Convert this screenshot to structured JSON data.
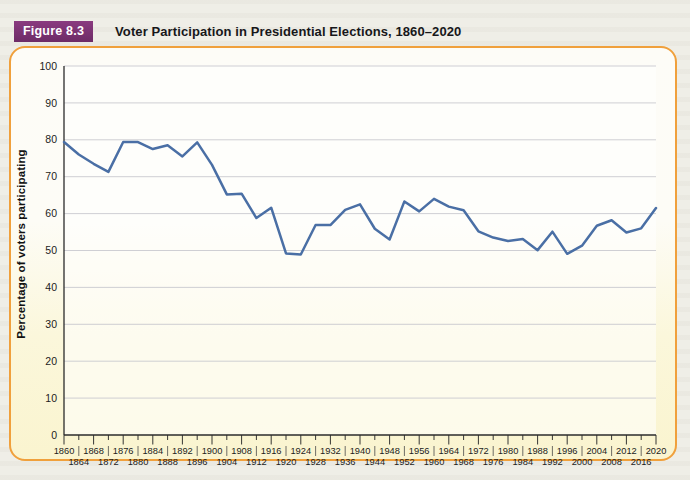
{
  "figure": {
    "badge": "Figure 8.3",
    "title": "Voter Participation in Presidential Elections, 1860–2020"
  },
  "colors": {
    "badge_bg": "#77306f",
    "panel_border": "#f0a03c",
    "line": "#4a6fa5",
    "grid": "#c9c9cf",
    "axis": "#2b2b2b",
    "page_bg": "#efeee7"
  },
  "chart_data": {
    "type": "line",
    "title": "Voter Participation in Presidential Elections, 1860–2020",
    "xlabel": "",
    "ylabel": "Percentage of voters participating",
    "ylim": [
      0,
      100
    ],
    "ytick_step": 10,
    "yticks": [
      0,
      10,
      20,
      30,
      40,
      50,
      60,
      70,
      80,
      90,
      100
    ],
    "grid": true,
    "legend": "none",
    "xlim": [
      1860,
      2020
    ],
    "x": [
      1860,
      1864,
      1868,
      1872,
      1876,
      1880,
      1884,
      1888,
      1892,
      1896,
      1900,
      1904,
      1908,
      1912,
      1916,
      1920,
      1924,
      1928,
      1932,
      1936,
      1940,
      1944,
      1948,
      1952,
      1956,
      1960,
      1964,
      1968,
      1972,
      1976,
      1980,
      1984,
      1988,
      1992,
      1996,
      2000,
      2004,
      2008,
      2012,
      2016,
      2020
    ],
    "categories": [
      "1860",
      "1864",
      "1868",
      "1872",
      "1876",
      "1880",
      "1884",
      "1888",
      "1892",
      "1896",
      "1900",
      "1904",
      "1908",
      "1912",
      "1916",
      "1920",
      "1924",
      "1928",
      "1932",
      "1936",
      "1940",
      "1944",
      "1948",
      "1952",
      "1956",
      "1960",
      "1964",
      "1968",
      "1972",
      "1976",
      "1980",
      "1984",
      "1988",
      "1992",
      "1996",
      "2000",
      "2004",
      "2008",
      "2012",
      "2016",
      "2020"
    ],
    "xtick_labels_top": [
      "1860",
      "1868",
      "1876",
      "1884",
      "1892",
      "1900",
      "1908",
      "1916",
      "1924",
      "1932",
      "1940",
      "1948",
      "1956",
      "1964",
      "1972",
      "1980",
      "1988",
      "1996",
      "2004",
      "2012",
      "2020"
    ],
    "xtick_labels_bottom": [
      "1864",
      "1872",
      "1880",
      "1888",
      "1896",
      "1904",
      "1912",
      "1920",
      "1928",
      "1936",
      "1944",
      "1952",
      "1960",
      "1968",
      "1976",
      "1984",
      "1992",
      "2000",
      "2008",
      "2016"
    ],
    "series": [
      {
        "name": "Percentage of voters participating",
        "color": "#4a6fa5",
        "values": [
          79.4,
          76.0,
          73.5,
          71.3,
          79.4,
          79.4,
          77.5,
          78.5,
          75.5,
          79.3,
          73.2,
          65.2,
          65.4,
          58.8,
          61.6,
          49.2,
          48.9,
          56.9,
          56.9,
          61.0,
          62.5,
          55.9,
          53.0,
          63.3,
          60.6,
          64.0,
          61.9,
          60.9,
          55.2,
          53.5,
          52.6,
          53.1,
          50.1,
          55.1,
          49.1,
          51.3,
          56.7,
          58.2,
          54.9,
          56.0,
          61.5
        ]
      }
    ]
  }
}
